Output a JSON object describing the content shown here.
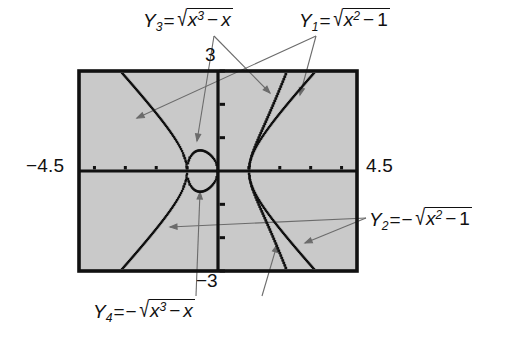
{
  "figure": {
    "background": "#ffffff",
    "plot_fill": "#c9c9c9",
    "frame_color": "#111111",
    "curve_color": "#111111",
    "leader_color": "#6b6b6b"
  },
  "window": {
    "xmin_label": "−4.5",
    "xmax_label": "4.5",
    "ymax_label": "3",
    "ymin_label": "−3",
    "xmin": -4.5,
    "xmax": 4.5,
    "ymin": -3,
    "ymax": 3
  },
  "labels": {
    "y3": {
      "name": "Y",
      "sub": "3",
      "eq": "=",
      "lead_minus": "",
      "radical": "√",
      "radicand_base": "x",
      "radicand_sup": "3",
      "radicand_op": "−",
      "radicand_tail": "x",
      "text": "Y3 = √(x3 − x)"
    },
    "y1": {
      "name": "Y",
      "sub": "1",
      "eq": "=",
      "lead_minus": "",
      "radical": "√",
      "radicand_base": "x",
      "radicand_sup": "2",
      "radicand_op": "−",
      "radicand_tail": "1",
      "text": "Y1 = √(x2 − 1)"
    },
    "y2": {
      "name": "Y",
      "sub": "2",
      "eq": "=",
      "lead_minus": "−",
      "radical": "√",
      "radicand_base": "x",
      "radicand_sup": "2",
      "radicand_op": "−",
      "radicand_tail": "1",
      "text": "Y2 = −√(x2 − 1)"
    },
    "y4": {
      "name": "Y",
      "sub": "4",
      "eq": "=",
      "lead_minus": "−",
      "radical": "√",
      "radicand_base": "x",
      "radicand_sup": "3",
      "radicand_op": "−",
      "radicand_tail": "x",
      "text": "Y4 = −√(x3 − x)"
    }
  },
  "chart_data": {
    "type": "line",
    "title": "",
    "xlabel": "",
    "ylabel": "",
    "xlim": [
      -4.5,
      4.5
    ],
    "ylim": [
      -3,
      3
    ],
    "grid": false,
    "legend": "callout-labels",
    "axes_style": "calculator-screen-with-tick-marks",
    "x_tick_spacing": 1,
    "y_tick_spacing": 1,
    "series": [
      {
        "name": "Y1",
        "expression": "sqrt(x^2 - 1)",
        "style": "dotted",
        "domain": "|x| >= 1",
        "points": [
          [
            -4.5,
            4.387
          ],
          [
            -4.2,
            4.079
          ],
          [
            -3.9,
            3.77
          ],
          [
            -3.6,
            3.458
          ],
          [
            -3.3,
            3.146
          ],
          [
            -3.0,
            2.828
          ],
          [
            -2.7,
            2.508
          ],
          [
            -2.4,
            2.182
          ],
          [
            -2.1,
            1.847
          ],
          [
            -1.8,
            1.497
          ],
          [
            -1.5,
            1.118
          ],
          [
            -1.3,
            0.831
          ],
          [
            -1.15,
            0.569
          ],
          [
            -1.05,
            0.32
          ],
          [
            -1.0,
            0.0
          ],
          [
            1.0,
            0.0
          ],
          [
            1.05,
            0.32
          ],
          [
            1.15,
            0.569
          ],
          [
            1.3,
            0.831
          ],
          [
            1.5,
            1.118
          ],
          [
            1.8,
            1.497
          ],
          [
            2.1,
            1.847
          ],
          [
            2.4,
            2.182
          ],
          [
            2.7,
            2.508
          ],
          [
            3.0,
            2.828
          ],
          [
            3.3,
            3.146
          ]
        ]
      },
      {
        "name": "Y2",
        "expression": "-sqrt(x^2 - 1)",
        "style": "dotted",
        "domain": "|x| >= 1",
        "points": [
          [
            -4.5,
            -4.387
          ],
          [
            -4.2,
            -4.079
          ],
          [
            -3.9,
            -3.77
          ],
          [
            -3.6,
            -3.458
          ],
          [
            -3.3,
            -3.146
          ],
          [
            -3.0,
            -2.828
          ],
          [
            -2.7,
            -2.508
          ],
          [
            -2.4,
            -2.182
          ],
          [
            -2.1,
            -1.847
          ],
          [
            -1.8,
            -1.497
          ],
          [
            -1.5,
            -1.118
          ],
          [
            -1.3,
            -0.831
          ],
          [
            -1.15,
            -0.569
          ],
          [
            -1.05,
            -0.32
          ],
          [
            -1.0,
            0.0
          ],
          [
            1.0,
            0.0
          ],
          [
            1.05,
            -0.32
          ],
          [
            1.15,
            -0.569
          ],
          [
            1.3,
            -0.831
          ],
          [
            1.5,
            -1.118
          ],
          [
            1.8,
            -1.497
          ],
          [
            2.1,
            -1.847
          ],
          [
            2.4,
            -2.182
          ],
          [
            2.7,
            -2.508
          ],
          [
            3.0,
            -2.828
          ],
          [
            3.3,
            -3.146
          ]
        ]
      },
      {
        "name": "Y3",
        "expression": "sqrt(x^3 - x)",
        "style": "dotted",
        "domain": "-1 <= x <= 0  or  x >= 1",
        "points": [
          [
            -1.0,
            0.0
          ],
          [
            -0.95,
            0.306
          ],
          [
            -0.9,
            0.4
          ],
          [
            -0.8,
            0.49
          ],
          [
            -0.7,
            0.527
          ],
          [
            -0.6,
            0.53
          ],
          [
            -0.577,
            0.5311
          ],
          [
            -0.5,
            0.515
          ],
          [
            -0.4,
            0.458
          ],
          [
            -0.3,
            0.384
          ],
          [
            -0.2,
            0.28
          ],
          [
            -0.1,
            0.197
          ],
          [
            0.0,
            0.0
          ],
          [
            1.0,
            0.0
          ],
          [
            1.1,
            0.492
          ],
          [
            1.2,
            0.718
          ],
          [
            1.3,
            0.9
          ],
          [
            1.4,
            1.067
          ],
          [
            1.5,
            1.225
          ],
          [
            1.7,
            1.53
          ],
          [
            1.9,
            1.836
          ],
          [
            2.1,
            2.15
          ],
          [
            2.3,
            2.479
          ],
          [
            2.5,
            2.82
          ],
          [
            2.65,
            3.087
          ]
        ]
      },
      {
        "name": "Y4",
        "expression": "-sqrt(x^3 - x)",
        "style": "dotted",
        "domain": "-1 <= x <= 0  or  x >= 1",
        "points": [
          [
            -1.0,
            0.0
          ],
          [
            -0.95,
            -0.306
          ],
          [
            -0.9,
            -0.4
          ],
          [
            -0.8,
            -0.49
          ],
          [
            -0.7,
            -0.527
          ],
          [
            -0.6,
            -0.53
          ],
          [
            -0.577,
            -0.5311
          ],
          [
            -0.5,
            -0.515
          ],
          [
            -0.4,
            -0.458
          ],
          [
            -0.3,
            -0.384
          ],
          [
            -0.2,
            -0.28
          ],
          [
            -0.1,
            -0.197
          ],
          [
            0.0,
            0.0
          ],
          [
            1.0,
            0.0
          ],
          [
            1.1,
            -0.492
          ],
          [
            1.2,
            -0.718
          ],
          [
            1.3,
            -0.9
          ],
          [
            1.4,
            -1.067
          ],
          [
            1.5,
            -1.225
          ],
          [
            1.7,
            -1.53
          ],
          [
            1.9,
            -1.836
          ],
          [
            2.1,
            -2.15
          ],
          [
            2.3,
            -2.479
          ],
          [
            2.5,
            -2.82
          ],
          [
            2.65,
            -3.087
          ]
        ]
      }
    ],
    "annotations": [
      {
        "label": "Y3",
        "target_curve": "Y3",
        "position": "top-left"
      },
      {
        "label": "Y1",
        "target_curve": "Y1",
        "position": "top-right"
      },
      {
        "label": "Y2",
        "target_curve": "Y2",
        "position": "right"
      },
      {
        "label": "Y4",
        "target_curve": "Y4",
        "position": "bottom-left"
      }
    ]
  }
}
